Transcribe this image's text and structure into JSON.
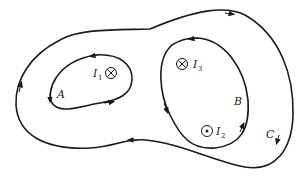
{
  "diagram": {
    "type": "ampere-loops",
    "loops": [
      {
        "id": "A",
        "label": "A",
        "encloses": [
          "I1"
        ]
      },
      {
        "id": "B",
        "label": "B",
        "encloses": [
          "I3",
          "I2"
        ]
      },
      {
        "id": "C",
        "label": "C",
        "encloses": [
          "I1",
          "I3",
          "I2"
        ]
      }
    ],
    "currents": [
      {
        "id": "I1",
        "label": "I",
        "subscript": "1",
        "direction": "into-page",
        "symbol": "⊗"
      },
      {
        "id": "I3",
        "label": "I",
        "subscript": "3",
        "direction": "into-page",
        "symbol": "⊗"
      },
      {
        "id": "I2",
        "label": "I",
        "subscript": "2",
        "direction": "out-of-page",
        "symbol": "⊙"
      }
    ],
    "colors": {
      "line": "#1a1a1a",
      "background": "#ffffff"
    }
  }
}
